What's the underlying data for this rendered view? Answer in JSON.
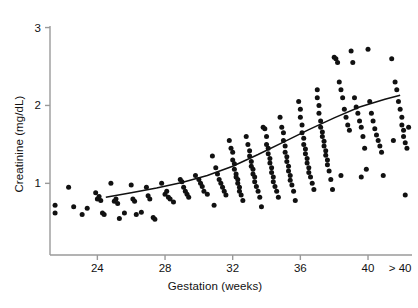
{
  "chart_data": {
    "type": "scatter",
    "title": "",
    "xlabel": "Gestation (weeks)",
    "ylabel": "Creatinine (mg/dL)",
    "xlim": [
      21.2,
      42.6
    ],
    "ylim": [
      0.08,
      3.02
    ],
    "grid": false,
    "legend": null,
    "x_tick_labels": [
      "24",
      "28",
      "32",
      "36",
      "40",
      "> 40"
    ],
    "x_tick_values": [
      24,
      28,
      32,
      36,
      40,
      41.9
    ],
    "y_tick_labels": [
      "1",
      "2",
      "3"
    ],
    "y_tick_values": [
      1,
      2,
      3
    ],
    "series": [
      {
        "name": "Creatinine measurements",
        "marker": "filled-circle",
        "color": "#111111",
        "points": [
          [
            21.5,
            0.72
          ],
          [
            21.5,
            0.62
          ],
          [
            22.3,
            0.95
          ],
          [
            22.6,
            0.7
          ],
          [
            23.1,
            0.6
          ],
          [
            23.4,
            0.68
          ],
          [
            23.9,
            0.88
          ],
          [
            24.0,
            0.8
          ],
          [
            24.1,
            0.83
          ],
          [
            24.2,
            0.78
          ],
          [
            24.3,
            0.62
          ],
          [
            24.4,
            0.6
          ],
          [
            24.8,
            1.0
          ],
          [
            25.0,
            0.77
          ],
          [
            25.1,
            0.8
          ],
          [
            25.2,
            0.74
          ],
          [
            25.3,
            0.55
          ],
          [
            25.6,
            0.62
          ],
          [
            26.0,
            0.98
          ],
          [
            26.1,
            0.8
          ],
          [
            26.2,
            0.77
          ],
          [
            26.3,
            0.6
          ],
          [
            26.6,
            0.63
          ],
          [
            26.9,
            0.95
          ],
          [
            27.0,
            0.84
          ],
          [
            27.1,
            0.8
          ],
          [
            27.3,
            0.56
          ],
          [
            27.4,
            0.54
          ],
          [
            27.8,
            1.0
          ],
          [
            28.0,
            0.86
          ],
          [
            28.1,
            0.9
          ],
          [
            28.2,
            0.82
          ],
          [
            28.3,
            0.8
          ],
          [
            28.5,
            0.76
          ],
          [
            28.9,
            1.05
          ],
          [
            29.0,
            1.02
          ],
          [
            29.1,
            0.95
          ],
          [
            29.2,
            0.9
          ],
          [
            29.3,
            0.86
          ],
          [
            29.4,
            0.82
          ],
          [
            29.8,
            1.1
          ],
          [
            30.0,
            1.05
          ],
          [
            30.1,
            1.0
          ],
          [
            30.2,
            0.96
          ],
          [
            30.3,
            0.9
          ],
          [
            30.5,
            0.86
          ],
          [
            30.8,
            1.35
          ],
          [
            31.0,
            1.2
          ],
          [
            31.1,
            1.12
          ],
          [
            31.2,
            1.05
          ],
          [
            31.3,
            1.0
          ],
          [
            31.4,
            0.95
          ],
          [
            31.5,
            0.9
          ],
          [
            31.6,
            0.85
          ],
          [
            31.8,
            1.55
          ],
          [
            31.9,
            1.45
          ],
          [
            32.0,
            1.4
          ],
          [
            32.0,
            1.3
          ],
          [
            32.1,
            1.25
          ],
          [
            32.1,
            1.18
          ],
          [
            32.2,
            1.12
          ],
          [
            32.2,
            1.08
          ],
          [
            32.3,
            1.05
          ],
          [
            32.3,
            1.0
          ],
          [
            32.4,
            0.95
          ],
          [
            32.4,
            0.9
          ],
          [
            32.5,
            0.85
          ],
          [
            32.6,
            0.78
          ],
          [
            32.8,
            1.6
          ],
          [
            32.9,
            1.5
          ],
          [
            33.0,
            1.42
          ],
          [
            33.0,
            1.35
          ],
          [
            33.1,
            1.28
          ],
          [
            33.1,
            1.22
          ],
          [
            33.2,
            1.18
          ],
          [
            33.2,
            1.12
          ],
          [
            33.3,
            1.08
          ],
          [
            33.3,
            1.02
          ],
          [
            33.4,
            0.96
          ],
          [
            33.5,
            0.9
          ],
          [
            33.6,
            0.82
          ],
          [
            33.7,
            0.7
          ],
          [
            33.9,
            1.7
          ],
          [
            34.0,
            1.6
          ],
          [
            34.0,
            1.5
          ],
          [
            34.1,
            1.45
          ],
          [
            34.1,
            1.38
          ],
          [
            34.2,
            1.32
          ],
          [
            34.2,
            1.26
          ],
          [
            34.3,
            1.2
          ],
          [
            34.3,
            1.14
          ],
          [
            34.4,
            1.08
          ],
          [
            34.4,
            1.02
          ],
          [
            34.5,
            0.96
          ],
          [
            34.6,
            0.9
          ],
          [
            34.7,
            0.82
          ],
          [
            34.8,
            1.85
          ],
          [
            34.9,
            1.72
          ],
          [
            35.0,
            1.65
          ],
          [
            35.0,
            1.55
          ],
          [
            35.1,
            1.48
          ],
          [
            35.1,
            1.4
          ],
          [
            35.2,
            1.34
          ],
          [
            35.2,
            1.28
          ],
          [
            35.3,
            1.22
          ],
          [
            35.3,
            1.16
          ],
          [
            35.4,
            1.1
          ],
          [
            35.4,
            1.04
          ],
          [
            35.5,
            0.98
          ],
          [
            35.6,
            0.9
          ],
          [
            35.7,
            0.78
          ],
          [
            35.9,
            2.05
          ],
          [
            36.0,
            1.95
          ],
          [
            36.0,
            1.85
          ],
          [
            36.1,
            1.75
          ],
          [
            36.1,
            1.65
          ],
          [
            36.2,
            1.58
          ],
          [
            36.2,
            1.5
          ],
          [
            36.3,
            1.44
          ],
          [
            36.3,
            1.38
          ],
          [
            36.4,
            1.32
          ],
          [
            36.4,
            1.26
          ],
          [
            36.5,
            1.2
          ],
          [
            36.5,
            1.14
          ],
          [
            36.6,
            1.08
          ],
          [
            36.7,
            1.0
          ],
          [
            36.8,
            0.92
          ],
          [
            37.0,
            2.2
          ],
          [
            37.0,
            2.1
          ],
          [
            37.1,
            2.0
          ],
          [
            37.1,
            1.9
          ],
          [
            37.2,
            1.8
          ],
          [
            37.2,
            1.72
          ],
          [
            37.3,
            1.66
          ],
          [
            37.3,
            1.6
          ],
          [
            37.4,
            1.54
          ],
          [
            37.4,
            1.48
          ],
          [
            37.5,
            1.42
          ],
          [
            37.5,
            1.36
          ],
          [
            37.6,
            1.3
          ],
          [
            37.6,
            1.24
          ],
          [
            37.7,
            1.16
          ],
          [
            37.8,
            1.05
          ],
          [
            37.9,
            0.92
          ],
          [
            38.0,
            2.62
          ],
          [
            38.1,
            2.6
          ],
          [
            38.2,
            2.55
          ],
          [
            38.3,
            2.3
          ],
          [
            38.4,
            2.2
          ],
          [
            38.5,
            2.1
          ],
          [
            38.6,
            1.95
          ],
          [
            38.7,
            1.85
          ],
          [
            38.8,
            1.75
          ],
          [
            38.9,
            1.68
          ],
          [
            39.0,
            2.7
          ],
          [
            39.1,
            2.55
          ],
          [
            39.2,
            2.1
          ],
          [
            39.3,
            1.98
          ],
          [
            39.4,
            1.9
          ],
          [
            39.5,
            1.8
          ],
          [
            39.6,
            1.72
          ],
          [
            39.7,
            1.6
          ],
          [
            39.8,
            1.45
          ],
          [
            39.9,
            1.18
          ],
          [
            40.0,
            2.72
          ],
          [
            40.1,
            2.05
          ],
          [
            40.2,
            1.9
          ],
          [
            40.3,
            1.8
          ],
          [
            40.4,
            1.7
          ],
          [
            40.5,
            1.62
          ],
          [
            40.6,
            1.55
          ],
          [
            40.7,
            1.48
          ],
          [
            40.8,
            1.4
          ],
          [
            40.9,
            1.1
          ],
          [
            41.4,
            2.6
          ],
          [
            41.6,
            2.3
          ],
          [
            41.7,
            2.2
          ],
          [
            41.8,
            2.05
          ],
          [
            41.9,
            1.95
          ],
          [
            42.0,
            1.85
          ],
          [
            42.0,
            1.75
          ],
          [
            42.1,
            1.68
          ],
          [
            42.1,
            1.6
          ],
          [
            42.2,
            1.52
          ],
          [
            42.3,
            1.45
          ],
          [
            42.2,
            0.85
          ],
          [
            42.4,
            1.72
          ],
          [
            41.5,
            1.55
          ],
          [
            38.4,
            1.1
          ],
          [
            39.6,
            1.08
          ],
          [
            33.8,
            1.72
          ],
          [
            30.9,
            0.72
          ]
        ]
      }
    ],
    "fit_curve": {
      "name": "Fitted trend",
      "color": "#111111",
      "points": [
        [
          24.5,
          0.82
        ],
        [
          26.0,
          0.88
        ],
        [
          27.5,
          0.94
        ],
        [
          29.0,
          1.01
        ],
        [
          30.5,
          1.1
        ],
        [
          32.0,
          1.22
        ],
        [
          33.5,
          1.37
        ],
        [
          35.0,
          1.53
        ],
        [
          36.5,
          1.69
        ],
        [
          38.0,
          1.84
        ],
        [
          39.5,
          1.98
        ],
        [
          41.0,
          2.08
        ],
        [
          41.9,
          2.13
        ]
      ]
    }
  }
}
